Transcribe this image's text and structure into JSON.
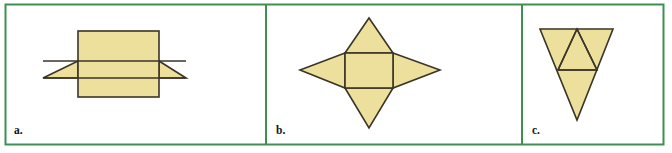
{
  "figure": {
    "width": 672,
    "height": 153,
    "background_color": "#ffffff",
    "border_color": "#3f8f52",
    "border_width": 2,
    "shape_fill_color": "#ece09c",
    "shape_stroke_color": "#3b3526",
    "shape_stroke_width": 1.6,
    "label_color": "#121212"
  },
  "border": {
    "x": 5.5,
    "y": 4.5,
    "width": 658,
    "height": 140
  },
  "dividers": [
    {
      "name": "divider-a-b",
      "x": 266
    },
    {
      "name": "divider-b-c",
      "x": 522
    }
  ],
  "panels": [
    {
      "id": "a",
      "label": "a.",
      "label_x": 14,
      "label_y": 134,
      "description": "Net of a triangular prism: a rectangle with a horizontal band crossed by two triangles pointing left and right",
      "shapes": [
        {
          "name": "left-triangle",
          "type": "polygon",
          "points": "43,78 78,61 78,78"
        },
        {
          "name": "right-triangle",
          "type": "polygon",
          "points": "186,78 159,61 159,78"
        },
        {
          "name": "outer-rectangle",
          "type": "rect",
          "x": 78,
          "y": 31,
          "width": 81,
          "height": 66
        },
        {
          "name": "band-line-top",
          "type": "line",
          "x1": 43,
          "y1": 61,
          "x2": 186,
          "y2": 61
        },
        {
          "name": "band-line-bottom",
          "type": "line",
          "x1": 43,
          "y1": 78,
          "x2": 186,
          "y2": 78
        }
      ]
    },
    {
      "id": "b",
      "label": "b.",
      "label_x": 276,
      "label_y": 134,
      "description": "Four pointed star net: a central rectangle with a triangle on each of its four sides",
      "shapes": [
        {
          "name": "top-triangle",
          "type": "polygon",
          "points": "345,53 369,18 393,53"
        },
        {
          "name": "bottom-triangle",
          "type": "polygon",
          "points": "345,88 369,128 393,88"
        },
        {
          "name": "left-triangle",
          "type": "polygon",
          "points": "345,53 300,70 345,88"
        },
        {
          "name": "right-triangle",
          "type": "polygon",
          "points": "393,53 440,70 393,88"
        },
        {
          "name": "center-rectangle",
          "type": "rect",
          "x": 345,
          "y": 53,
          "width": 48,
          "height": 35
        }
      ]
    },
    {
      "id": "c",
      "label": "c.",
      "label_x": 532,
      "label_y": 134,
      "description": "Net of a tetrahedron: a large downward pointing triangle containing an inner upward pointing triangle",
      "shapes": [
        {
          "name": "outer-triangle",
          "type": "polygon",
          "points": "540,29 613,29 577,120"
        },
        {
          "name": "inner-triangle",
          "type": "polygon",
          "points": "577,29 597,70 558,70"
        },
        {
          "name": "inner-left-edge",
          "type": "line",
          "x1": 577,
          "y1": 29,
          "x2": 558,
          "y2": 70
        },
        {
          "name": "inner-right-edge",
          "type": "line",
          "x1": 577,
          "y1": 29,
          "x2": 597,
          "y2": 70
        },
        {
          "name": "inner-base-edge",
          "type": "line",
          "x1": 558,
          "y1": 70,
          "x2": 597,
          "y2": 70
        }
      ]
    }
  ]
}
